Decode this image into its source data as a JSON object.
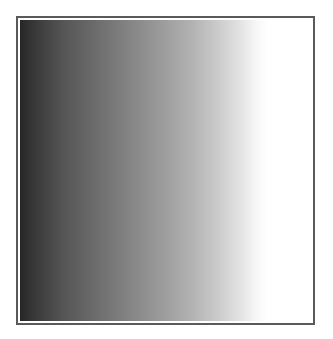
{
  "figure": {
    "type": "gradient-swatch",
    "direction": "left-to-right",
    "border_color": "#5a5a5a",
    "start_color": "#262626",
    "end_color": "#ffffff",
    "background": "#ffffff"
  }
}
